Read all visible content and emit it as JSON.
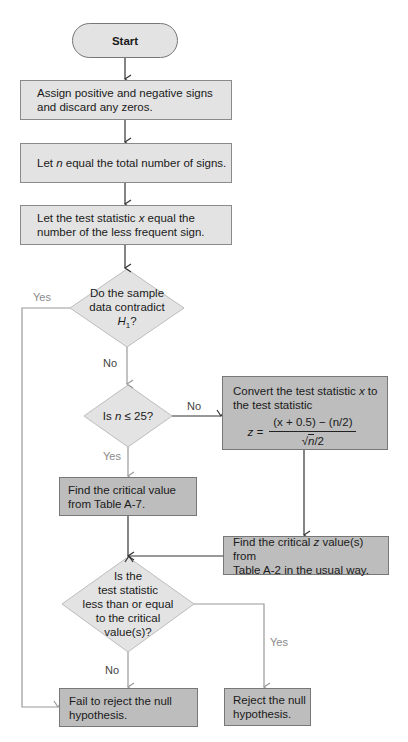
{
  "start": {
    "label": "Start"
  },
  "steps": {
    "assign": {
      "line1": "Assign positive and negative signs",
      "line2": "and discard any zeros."
    },
    "let_n": {
      "prefix": "Let ",
      "var": "n",
      "suffix": " equal the total number of signs."
    },
    "let_x": {
      "line1_prefix": "Let the test statistic ",
      "var": "x",
      "line1_suffix": " equal the",
      "line2": "number of the less frequent sign."
    },
    "convert": {
      "line1_prefix": "Convert the test statistic ",
      "var": "x",
      "line1_suffix": " to",
      "line2": "the test statistic",
      "formula_lhs": "z =",
      "formula_num": "(x + 0.5) − (n/2)",
      "formula_den_sqrt": "n",
      "formula_den_rest": "/2"
    },
    "find_critical_a7": {
      "line1": "Find the critical value",
      "line2": "from Table A-7."
    },
    "find_critical_z": {
      "line1_prefix": "Find the critical ",
      "var": "z",
      "line1_suffix": " value(s) from",
      "line2": "Table A-2 in the usual way."
    },
    "fail_reject": {
      "line1": "Fail to reject the null",
      "line2": "hypothesis."
    },
    "reject": {
      "line1": "Reject the null",
      "line2": "hypothesis."
    }
  },
  "decisions": {
    "contradict": {
      "line1": "Do the sample",
      "line2": "data contradict",
      "line3_var": "H",
      "line3_sub": "1",
      "line3_suffix": "?"
    },
    "n_le_25": {
      "prefix": "Is ",
      "var": "n",
      "suffix": " ≤ 25?"
    },
    "compare": {
      "line1": "Is the",
      "line2": "test statistic",
      "line3": "less than or equal",
      "line4": "to the critical",
      "line5": "value(s)?"
    }
  },
  "labels": {
    "contradict_yes": "Yes",
    "contradict_no": "No",
    "n_no": "No",
    "n_yes": "Yes",
    "compare_no": "No",
    "compare_yes": "Yes"
  },
  "colors": {
    "light_box": "#e3e3e3",
    "dark_box": "#bdbdbd",
    "line": "#333333",
    "gray_line": "#9a9a9a"
  }
}
